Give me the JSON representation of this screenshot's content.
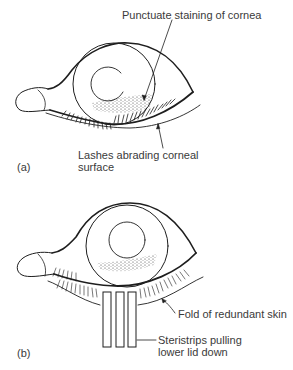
{
  "figure_a": {
    "panel_label": "(a)",
    "labels": {
      "punctuate": "Punctuate staining of cornea",
      "lashes_line1": "Lashes abrading corneal",
      "lashes_line2": "surface"
    }
  },
  "figure_b": {
    "panel_label": "(b)",
    "labels": {
      "fold": "Fold of redundant skin",
      "steri_line1": "Steristrips pulling",
      "steri_line2": "lower lid down"
    }
  },
  "colors": {
    "ink": "#1e1e1e",
    "text": "#3a3a3a",
    "background": "#ffffff"
  }
}
